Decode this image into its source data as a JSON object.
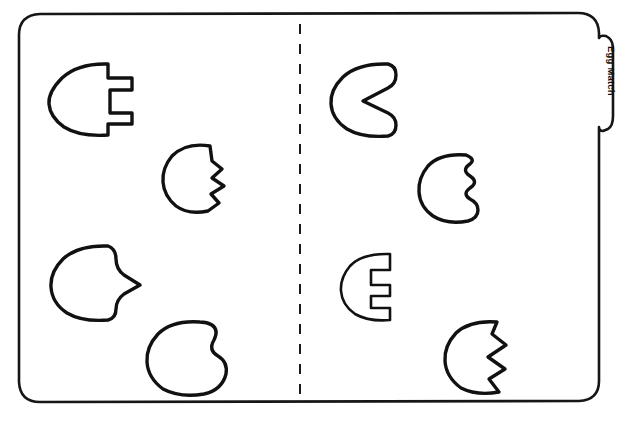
{
  "worksheet": {
    "title": "Egg Match",
    "tab_label": "Egg Match",
    "background_color": "#ffffff",
    "ink_color": "#111111",
    "width": 622,
    "height": 421,
    "style": "hand-drawn black line art on white",
    "fold_line": {
      "name": "center-fold-dashed-line",
      "orientation": "vertical",
      "x": 300,
      "y_start": 24,
      "y_end": 396,
      "dash": "10 10"
    },
    "border": {
      "name": "folder-outline",
      "shape": "rounded-rectangle-with-right-tab",
      "corner_radius": 22
    }
  },
  "pieces": {
    "left_column_label": "left half pieces",
    "right_column_label": "right half pieces",
    "left": [
      {
        "id": "left-1",
        "name": "egg-piece-square-tab",
        "edge_type": "square-tab",
        "match_id": "right-3",
        "x": 50,
        "y": 62
      },
      {
        "id": "left-2",
        "name": "egg-piece-zigzag-step",
        "edge_type": "zigzag-step",
        "match_id": "right-4",
        "x": 163,
        "y": 142
      },
      {
        "id": "left-3",
        "name": "egg-piece-arrow-point",
        "edge_type": "arrow-point",
        "match_id": "right-1",
        "x": 52,
        "y": 243
      },
      {
        "id": "left-4",
        "name": "egg-piece-round-lobe",
        "edge_type": "round-lobe",
        "match_id": "right-2",
        "x": 148,
        "y": 318
      }
    ],
    "right": [
      {
        "id": "right-1",
        "name": "egg-piece-v-notch",
        "edge_type": "v-notch",
        "match_id": "left-3",
        "x": 330,
        "y": 62
      },
      {
        "id": "right-2",
        "name": "egg-piece-wavy-scallop",
        "edge_type": "wavy-scallop",
        "match_id": "left-4",
        "x": 418,
        "y": 152
      },
      {
        "id": "right-3",
        "name": "egg-piece-square-notch",
        "edge_type": "square-notch",
        "match_id": "left-1",
        "x": 345,
        "y": 252
      },
      {
        "id": "right-4",
        "name": "egg-piece-zigzag-point",
        "edge_type": "zigzag-point",
        "match_id": "left-2",
        "x": 443,
        "y": 318
      }
    ]
  }
}
